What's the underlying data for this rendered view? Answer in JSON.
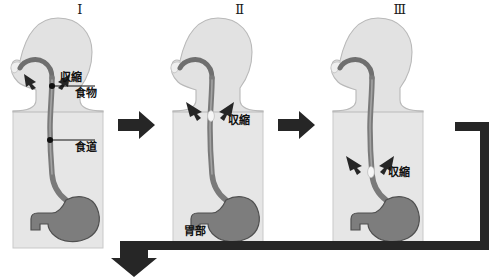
{
  "diagram": {
    "title_semantic": "peristalsis-swallowing-stages",
    "colors": {
      "body_fill": "#e2e2e2",
      "body_stroke": "#b4b4b4",
      "torso_fill": "#e6e6e6",
      "esophagus_dark": "#6f6f6f",
      "esophagus_light": "#9a9a9a",
      "stomach_fill": "#7d7d7d",
      "stomach_stroke": "#545454",
      "bolus_white": "#f4f4f4",
      "arrow_black": "#262626",
      "text": "#111111"
    },
    "stages": [
      {
        "numeral": "Ⅰ",
        "labels": [
          {
            "name": "contraction",
            "text": "収縮"
          },
          {
            "name": "food",
            "text": "食物"
          },
          {
            "name": "esophagus",
            "text": "食道"
          }
        ]
      },
      {
        "numeral": "Ⅱ",
        "labels": [
          {
            "name": "contraction",
            "text": "収縮"
          },
          {
            "name": "stomach",
            "text": "胃部"
          }
        ]
      },
      {
        "numeral": "Ⅲ",
        "labels": [
          {
            "name": "contraction",
            "text": "収縮"
          }
        ]
      }
    ],
    "flow_arrows": [
      {
        "name": "stage-1-to-2",
        "direction": "right"
      },
      {
        "name": "stage-2-to-3",
        "direction": "right"
      },
      {
        "name": "loop-back",
        "direction": "down-left"
      }
    ]
  }
}
